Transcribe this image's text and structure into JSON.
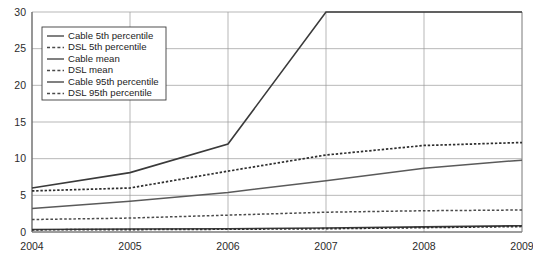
{
  "chart_data": {
    "type": "line",
    "title": "",
    "subtitle": "",
    "xlabel": "",
    "ylabel": "",
    "x": [
      2004,
      2005,
      2006,
      2007,
      2008,
      2009
    ],
    "categories": [
      "2004",
      "2005",
      "2006",
      "2007",
      "2008",
      "2009"
    ],
    "xlim": [
      2004,
      2009
    ],
    "ylim": [
      0,
      30
    ],
    "y_ticks": [
      0,
      5,
      10,
      15,
      20,
      25,
      30
    ],
    "y_tick_labels": [
      "0",
      "5",
      "10",
      "15",
      "20",
      "25",
      "30"
    ],
    "x_ticks": [
      2004,
      2005,
      2006,
      2007,
      2008,
      2009
    ],
    "x_tick_labels": [
      "2004",
      "2005",
      "2006",
      "2007",
      "2008",
      "2009"
    ],
    "grid": "both",
    "legend_position": "top-left",
    "series": [
      {
        "name": "Cable 5th percentile",
        "style": "solid",
        "color": "#3a3a3a",
        "values": [
          0.35,
          0.4,
          0.45,
          0.55,
          0.7,
          0.85
        ]
      },
      {
        "name": "DSL 5th percentile",
        "style": "dashed",
        "color": "#2e2e2e",
        "values": [
          0.3,
          0.33,
          0.38,
          0.45,
          0.6,
          0.75
        ]
      },
      {
        "name": "Cable mean",
        "style": "solid",
        "color": "#5a5a5a",
        "values": [
          3.2,
          4.2,
          5.4,
          7.0,
          8.7,
          9.8
        ]
      },
      {
        "name": "DSL mean",
        "style": "dashed",
        "color": "#4a4a4a",
        "values": [
          1.7,
          1.9,
          2.3,
          2.7,
          2.9,
          3.0
        ]
      },
      {
        "name": "Cable 95th percentile",
        "style": "solid",
        "color": "#5a5a5a",
        "values": [
          6.0,
          8.1,
          12.0,
          30.0,
          30.0,
          30.0
        ]
      },
      {
        "name": "DSL 95th percentile",
        "style": "dashed",
        "color": "#4a4a4a",
        "values": [
          5.6,
          6.0,
          8.3,
          10.5,
          11.8,
          12.2
        ]
      }
    ],
    "legend_entries": [
      "Cable 5th percentile",
      "DSL 5th percentile",
      "Cable mean",
      "DSL mean",
      "Cable 95th percentile",
      "DSL 95th percentile"
    ]
  },
  "colors": {
    "grid": "#9a9a9a",
    "axis": "#5e5e5e",
    "background": "#ffffff",
    "text": "#2b2b2b"
  }
}
